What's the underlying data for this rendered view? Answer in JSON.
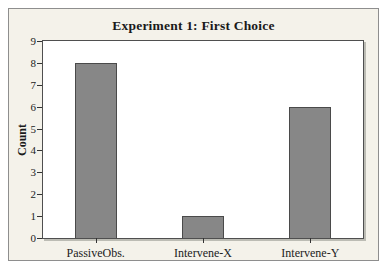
{
  "chart_data": {
    "type": "bar",
    "title": "Experiment 1: First Choice",
    "categories": [
      "PassiveObs.",
      "Intervene-X",
      "Intervene-Y"
    ],
    "values": [
      8,
      1,
      6
    ],
    "xlabel": "",
    "ylabel": "Count",
    "ylim": [
      0,
      9
    ],
    "yticks": [
      0,
      1,
      2,
      3,
      4,
      5,
      6,
      7,
      8,
      9
    ],
    "grid": false,
    "legend": null,
    "colors": {
      "bar_fill": "#878787",
      "bar_border": "#4a4a4a",
      "figure_background": "#f4f2ea",
      "plot_background": "#ffffff",
      "frame": "#4f4f4f",
      "text": "#1a1a1a"
    }
  }
}
